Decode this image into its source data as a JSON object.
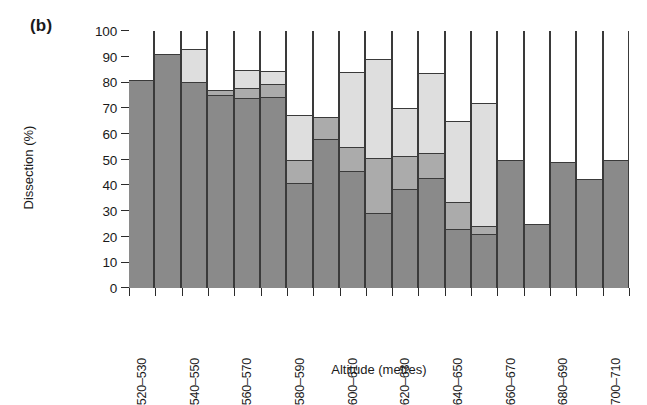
{
  "figure": {
    "panel_label": "(b)",
    "xlabel": "Altitude (metres)",
    "ylabel": "Dissection (%)"
  },
  "colors": {
    "series_dark": "#8a8a8a",
    "series_medium": "#ababab",
    "series_light": "#dedede",
    "series_white": "#ffffff",
    "outline": "#3a3a3a",
    "axis": "#2b2b2b",
    "background": "#ffffff"
  },
  "chart_data": {
    "type": "bar",
    "subtype": "stacked-bar",
    "title": "(b)",
    "xlabel": "Altitude (metres)",
    "ylabel": "Dissection (%)",
    "ylim": [
      0,
      100
    ],
    "yticks": [
      0,
      10,
      20,
      30,
      40,
      50,
      60,
      70,
      80,
      90,
      100
    ],
    "ytick_labels": [
      "0",
      "10",
      "20",
      "30",
      "40",
      "50",
      "60",
      "70",
      "80",
      "90",
      "100"
    ],
    "grid": false,
    "legend": "none",
    "n_bars": 14,
    "categories": [
      "520-530",
      "530-540",
      "540-550",
      "550-560",
      "560-570",
      "570-580",
      "580-590",
      "590-600",
      "600-610",
      "610-620",
      "620-630",
      "630-640",
      "640-650",
      "650-660",
      "660-670",
      "670-680",
      "680-690",
      "690-700",
      "700-710"
    ],
    "xtick_labels": [
      "520–530",
      "540–550",
      "560–570",
      "580–590",
      "600–610",
      "620–630",
      "640–650",
      "660–670",
      "680–690",
      "700–710"
    ],
    "series": [
      {
        "name": "dark-grey",
        "color": "#8a8a8a",
        "values": [
          81,
          91,
          80,
          75,
          74,
          74.5,
          41,
          58,
          45.5,
          29,
          38.5,
          43,
          23,
          21,
          50,
          25,
          49,
          42.5,
          50
        ]
      },
      {
        "name": "medium-grey",
        "color": "#ababab",
        "values": [
          0,
          0,
          0,
          2,
          4,
          5,
          9,
          8.5,
          9.5,
          21.5,
          13,
          9.5,
          10.5,
          3,
          0,
          0,
          0,
          0,
          0
        ]
      },
      {
        "name": "light-grey",
        "color": "#dedede",
        "values": [
          0,
          0,
          13,
          0,
          7,
          5,
          17.5,
          0,
          29,
          38.5,
          18.5,
          31,
          31.5,
          48,
          0,
          0,
          0,
          0,
          0
        ]
      },
      {
        "name": "white",
        "color": "#ffffff",
        "values": [
          19,
          9,
          7,
          23,
          15,
          15.5,
          32.5,
          33.5,
          16,
          11,
          30,
          16.5,
          35,
          28,
          50,
          75,
          51,
          57.5,
          50
        ]
      }
    ],
    "bars": [
      {
        "label": "520-530",
        "tick_label": "520–530",
        "segments": [
          81,
          0,
          0,
          19
        ]
      },
      {
        "label": "530-540",
        "tick_label": "",
        "segments": [
          91,
          0,
          0,
          9
        ]
      },
      {
        "label": "540-550",
        "tick_label": "540–550",
        "segments": [
          80,
          0,
          13,
          7
        ]
      },
      {
        "label": "550-560",
        "tick_label": "",
        "segments": [
          75,
          2,
          0,
          23
        ]
      },
      {
        "label": "560-570",
        "tick_label": "560–570",
        "segments": [
          74,
          4,
          7,
          15
        ]
      },
      {
        "label": "570-580",
        "tick_label": "",
        "segments": [
          74.5,
          5,
          5,
          15.5
        ]
      },
      {
        "label": "580-590",
        "tick_label": "580–590",
        "segments": [
          41,
          9,
          17.5,
          32.5
        ]
      },
      {
        "label": "590-600",
        "tick_label": "",
        "segments": [
          58,
          8.5,
          0,
          33.5
        ]
      },
      {
        "label": "600-610",
        "tick_label": "600–610",
        "segments": [
          45.5,
          9.5,
          29,
          16
        ]
      },
      {
        "label": "610-620",
        "tick_label": "",
        "segments": [
          29,
          21.5,
          38.5,
          11
        ]
      },
      {
        "label": "620-630",
        "tick_label": "620–630",
        "segments": [
          38.5,
          13,
          18.5,
          30
        ]
      },
      {
        "label": "630-640",
        "tick_label": "",
        "segments": [
          43,
          9.5,
          31,
          16.5
        ]
      },
      {
        "label": "640-650",
        "tick_label": "640–650",
        "segments": [
          23,
          10.5,
          31.5,
          35
        ]
      },
      {
        "label": "650-660",
        "tick_label": "",
        "segments": [
          21,
          3,
          48,
          28
        ]
      },
      {
        "label": "660-670",
        "tick_label": "660–670",
        "segments": [
          50,
          0,
          0,
          50
        ]
      },
      {
        "label": "670-680",
        "tick_label": "",
        "segments": [
          25,
          0,
          0,
          75
        ]
      },
      {
        "label": "680-690",
        "tick_label": "680–690",
        "segments": [
          49,
          0,
          0,
          51
        ]
      },
      {
        "label": "690-700",
        "tick_label": "",
        "segments": [
          42.5,
          0,
          0,
          57.5
        ]
      },
      {
        "label": "700-710",
        "tick_label": "700–710",
        "segments": [
          50,
          0,
          0,
          50
        ]
      }
    ]
  }
}
